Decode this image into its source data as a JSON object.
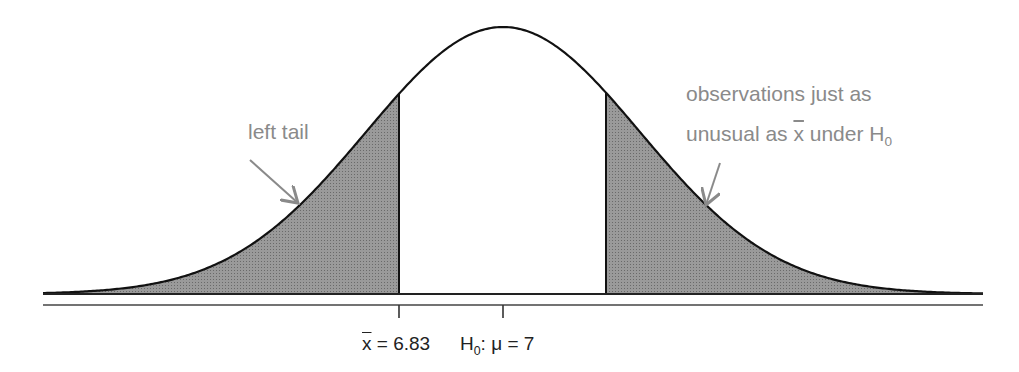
{
  "diagram": {
    "type": "normal-distribution-two-tailed",
    "mean_label": "H",
    "mean_label_sub": "0",
    "mean_label_rest": ": μ = 7",
    "xbar_symbol": "x",
    "xbar_rest": " = 6.83",
    "annotations": {
      "left_tail": "left tail",
      "right_line1": "observations just as",
      "right_line2_a": "unusual as ",
      "right_line2_x": "x",
      "right_line2_b": " under H",
      "right_line2_sub": "0"
    },
    "colors": {
      "curve": "#111111",
      "shade": "#8c8c8c",
      "annotation_text": "#8a8a8a",
      "arrow": "#8a8a8a"
    }
  }
}
